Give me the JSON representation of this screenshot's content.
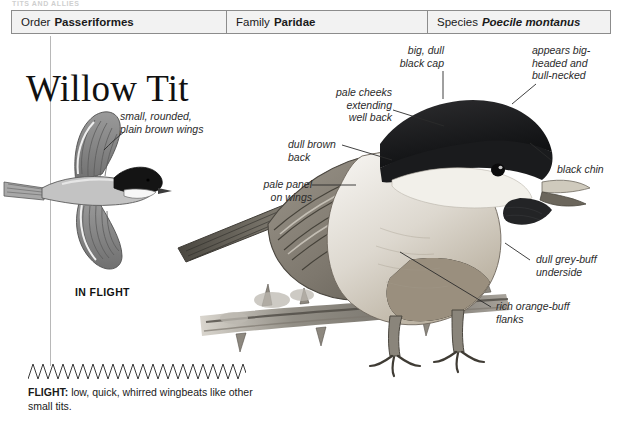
{
  "running_head": "TITS AND ALLIES",
  "taxonomy": {
    "order": {
      "label": "Order",
      "value": "Passeriformes"
    },
    "family": {
      "label": "Family",
      "value": "Paridae"
    },
    "species": {
      "label": "Species",
      "value": "Poecile montanus"
    }
  },
  "title": "Willow Tit",
  "annotations": {
    "wings": "small, rounded,\nplain brown wings",
    "cap": "big, dull\nblack cap",
    "head_shape": "appears big-\nheaded and\nbull-necked",
    "cheeks": "pale cheeks\nextending\nwell back",
    "back": "dull brown\nback",
    "wing_panel": "pale panel\non wings",
    "chin": "black chin",
    "underside": "dull grey-buff\nunderside",
    "flanks": "rich orange-buff\nflanks"
  },
  "in_flight_label": "IN FLIGHT",
  "flight": {
    "heading": "FLIGHT:",
    "description": " low, quick, whirred wingbeats like other small tits."
  },
  "colors": {
    "header_fill": "#f2f2f2",
    "header_border": "#8c8c8c",
    "text": "#1a1a1a",
    "annotation": "#2b2b2b",
    "cap_black": "#17181a",
    "cheek_pale": "#f3f1ec",
    "back_brown": "#8d8madd",
    "flank_buff": "#b7ad9c"
  }
}
